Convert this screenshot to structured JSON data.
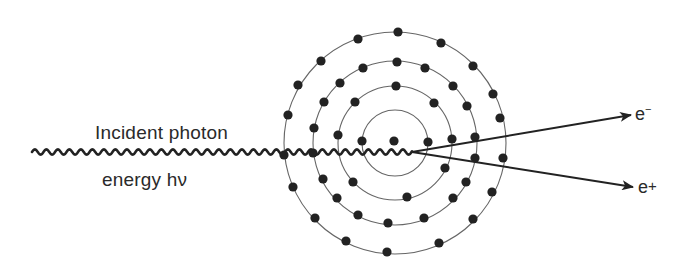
{
  "diagram": {
    "title_lines": {
      "line1": "Incident photon",
      "line2": "energy hν"
    },
    "products": {
      "electron": {
        "base": "e",
        "charge": "−"
      },
      "positron": {
        "base": "e",
        "charge": "+"
      }
    },
    "colors": {
      "ink": "#222222",
      "orbit": "#666666",
      "background": "#ffffff"
    },
    "atom": {
      "center": [
        395,
        143
      ],
      "nucleus": [
        394,
        141
      ],
      "orbit_radii": [
        33,
        57,
        82,
        111
      ],
      "electron_radius": 4.6,
      "shells": [
        {
          "name": "inner",
          "electrons": [
            [
              362,
              141
            ],
            [
              428,
              142
            ]
          ]
        },
        {
          "name": "third",
          "electrons": [
            [
              396,
              86
            ],
            [
              355,
              102
            ],
            [
              434,
              103
            ],
            [
              338,
              135
            ],
            [
              452,
              139
            ],
            [
              353,
              182
            ],
            [
              407,
              197
            ],
            [
              445,
              168
            ]
          ]
        },
        {
          "name": "second",
          "electrons": [
            [
              397,
              62
            ],
            [
              363,
              68
            ],
            [
              425,
              68
            ],
            [
              340,
              83
            ],
            [
              453,
              86
            ],
            [
              324,
              102
            ],
            [
              467,
              106
            ],
            [
              314,
              128
            ],
            [
              475,
              137
            ],
            [
              313,
              153
            ],
            [
              475,
              158
            ],
            [
              323,
              179
            ],
            [
              466,
              182
            ],
            [
              337,
              198
            ],
            [
              453,
              198
            ],
            [
              358,
              215
            ],
            [
              424,
              218
            ],
            [
              388,
              223
            ]
          ]
        },
        {
          "name": "outer",
          "electrons": [
            [
              398,
              32
            ],
            [
              358,
              39
            ],
            [
              441,
              43
            ],
            [
              321,
              61
            ],
            [
              473,
              66
            ],
            [
              298,
              85
            ],
            [
              493,
              94
            ],
            [
              288,
              115
            ],
            [
              500,
              118
            ],
            [
              284,
              155
            ],
            [
              503,
              158
            ],
            [
              293,
              187
            ],
            [
              492,
              192
            ],
            [
              315,
              218
            ],
            [
              473,
              219
            ],
            [
              346,
              241
            ],
            [
              439,
              243
            ],
            [
              387,
              252
            ]
          ]
        }
      ]
    },
    "photon_wave": {
      "start": [
        32,
        152
      ],
      "end": [
        412,
        152
      ],
      "period": 11.5,
      "amplitude": 2.6
    },
    "arrows": [
      {
        "name": "electron-track",
        "from": [
          412,
          152
        ],
        "to": [
          631,
          115
        ]
      },
      {
        "name": "positron-track",
        "from": [
          412,
          152
        ],
        "to": [
          633,
          187
        ]
      }
    ]
  }
}
